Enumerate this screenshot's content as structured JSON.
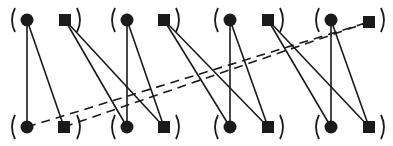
{
  "diagram": {
    "title": "",
    "colors": {
      "ink": "#1a1a1a",
      "background": "#ffffff"
    },
    "rows": {
      "top_y": 20,
      "bottom_y": 127
    },
    "groups": [
      {
        "id": "g1",
        "circle_x": 27,
        "square_x": 65,
        "paren_left_x": 12,
        "paren_right_x": 80
      },
      {
        "id": "g2",
        "circle_x": 127,
        "square_x": 164,
        "paren_left_x": 112,
        "paren_right_x": 179
      },
      {
        "id": "g3",
        "circle_x": 230,
        "square_x": 268,
        "paren_left_x": 215,
        "paren_right_x": 283
      },
      {
        "id": "g4",
        "circle_x": 331,
        "square_x": 369,
        "paren_left_x": 316,
        "paren_right_x": 384
      }
    ],
    "nodes": [
      {
        "id": "t1c",
        "shape": "circle",
        "row": "top",
        "x": 27,
        "y": 20
      },
      {
        "id": "t1s",
        "shape": "square",
        "row": "top",
        "x": 65,
        "y": 20
      },
      {
        "id": "t2c",
        "shape": "circle",
        "row": "top",
        "x": 127,
        "y": 20
      },
      {
        "id": "t2s",
        "shape": "square",
        "row": "top",
        "x": 164,
        "y": 20
      },
      {
        "id": "t3c",
        "shape": "circle",
        "row": "top",
        "x": 230,
        "y": 20
      },
      {
        "id": "t3s",
        "shape": "square",
        "row": "top",
        "x": 268,
        "y": 20
      },
      {
        "id": "t4c",
        "shape": "circle",
        "row": "top",
        "x": 331,
        "y": 20
      },
      {
        "id": "t4s",
        "shape": "square",
        "row": "top",
        "x": 369,
        "y": 22
      },
      {
        "id": "b1c",
        "shape": "circle",
        "row": "bottom",
        "x": 27,
        "y": 127
      },
      {
        "id": "b1s",
        "shape": "square",
        "row": "bottom",
        "x": 64,
        "y": 127
      },
      {
        "id": "b2c",
        "shape": "circle",
        "row": "bottom",
        "x": 127,
        "y": 127
      },
      {
        "id": "b2s",
        "shape": "square",
        "row": "bottom",
        "x": 164,
        "y": 127
      },
      {
        "id": "b3c",
        "shape": "circle",
        "row": "bottom",
        "x": 230,
        "y": 127
      },
      {
        "id": "b3s",
        "shape": "square",
        "row": "bottom",
        "x": 268,
        "y": 127
      },
      {
        "id": "b4c",
        "shape": "circle",
        "row": "bottom",
        "x": 331,
        "y": 127
      },
      {
        "id": "b4s",
        "shape": "square",
        "row": "bottom",
        "x": 369,
        "y": 127
      }
    ],
    "edges": [
      {
        "from": "t1c",
        "to": "b1c",
        "style": "solid"
      },
      {
        "from": "t1c",
        "to": "b1s",
        "style": "solid"
      },
      {
        "from": "t1s",
        "to": "b2c",
        "style": "solid"
      },
      {
        "from": "t1s",
        "to": "b2s",
        "style": "solid"
      },
      {
        "from": "t2c",
        "to": "b2c",
        "style": "solid"
      },
      {
        "from": "t2c",
        "to": "b2s",
        "style": "solid"
      },
      {
        "from": "t2s",
        "to": "b3c",
        "style": "solid"
      },
      {
        "from": "t2s",
        "to": "b3s",
        "style": "solid"
      },
      {
        "from": "t3c",
        "to": "b3c",
        "style": "solid"
      },
      {
        "from": "t3c",
        "to": "b3s",
        "style": "solid"
      },
      {
        "from": "t3s",
        "to": "b4c",
        "style": "solid"
      },
      {
        "from": "t3s",
        "to": "b4s",
        "style": "solid"
      },
      {
        "from": "t4c",
        "to": "b4c",
        "style": "solid"
      },
      {
        "from": "t4c",
        "to": "b4s",
        "style": "solid"
      },
      {
        "from": "b1c",
        "to": "t4s",
        "style": "dashed"
      },
      {
        "from": "b1s",
        "to": "t4s",
        "style": "dashed"
      }
    ]
  }
}
